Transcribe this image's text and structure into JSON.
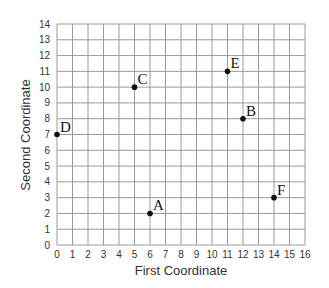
{
  "chart_data": {
    "type": "scatter",
    "title": "",
    "xlabel": "First Coordinate",
    "ylabel": "Second Coordinate",
    "xlim": [
      0,
      16
    ],
    "ylim": [
      0,
      14
    ],
    "grid": true,
    "legend": null,
    "x_ticks": [
      0,
      1,
      2,
      3,
      4,
      5,
      6,
      7,
      8,
      9,
      10,
      11,
      12,
      13,
      14,
      15,
      16
    ],
    "y_ticks": [
      0,
      1,
      2,
      3,
      4,
      5,
      6,
      7,
      8,
      9,
      10,
      11,
      12,
      13,
      14
    ],
    "points": [
      {
        "label": "A",
        "x": 6,
        "y": 2
      },
      {
        "label": "B",
        "x": 12,
        "y": 8
      },
      {
        "label": "C",
        "x": 5,
        "y": 10
      },
      {
        "label": "D",
        "x": 0,
        "y": 7
      },
      {
        "label": "E",
        "x": 11,
        "y": 11
      },
      {
        "label": "F",
        "x": 14,
        "y": 3
      }
    ],
    "colors": {
      "grid": "#9a9a9a",
      "point": "#111111",
      "text": "#333333"
    }
  }
}
